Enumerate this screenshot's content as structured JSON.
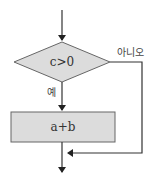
{
  "flowchart": {
    "decision": {
      "label": "c>0",
      "fill": "#dcdcdc"
    },
    "process": {
      "label": "a+b",
      "fill": "#dcdcdc"
    },
    "branches": {
      "yes_label": "예",
      "no_label": "아니오"
    },
    "line_color": "#333333"
  }
}
